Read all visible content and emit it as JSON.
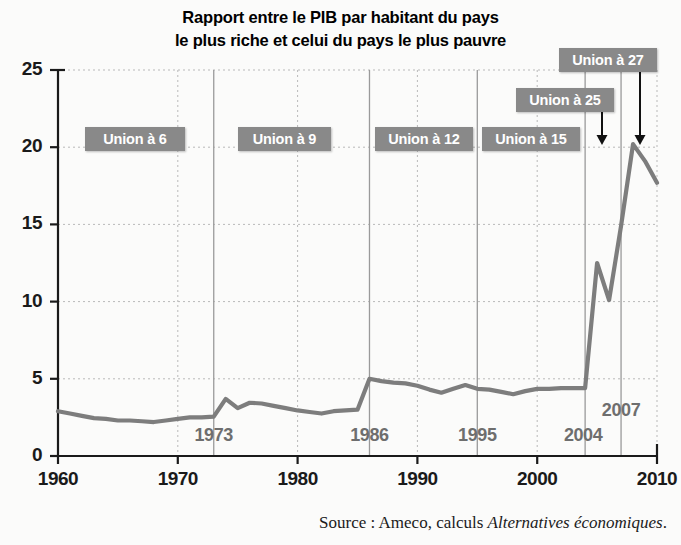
{
  "title": {
    "line1": "Rapport entre le PIB par habitant du pays",
    "line2": "le plus riche et celui du pays le plus pauvre"
  },
  "source": {
    "prefix": "Source : Ameco, calculs ",
    "emphasis": "Alternatives économiques",
    "suffix": "."
  },
  "colors": {
    "line": "#7d7d7d",
    "badge_bg": "#898989",
    "badge_text": "#ffffff",
    "axis": "#1a1a1a",
    "grid": "#b9b9b9",
    "event_line": "#9a9a9a",
    "event_label": "#6e6e6e",
    "arrow": "#111111",
    "background": "#fbfbfa"
  },
  "badges": [
    {
      "label": "Union à 6",
      "x": 85,
      "y": 127,
      "width": 100
    },
    {
      "label": "Union à 9",
      "x": 238,
      "y": 127,
      "width": 93
    },
    {
      "label": "Union à 12",
      "x": 375,
      "y": 127,
      "width": 98
    },
    {
      "label": "Union à 15",
      "x": 482,
      "y": 127,
      "width": 98
    },
    {
      "label": "Union à 25",
      "x": 516,
      "y": 88,
      "width": 98
    },
    {
      "label": "Union à 27",
      "x": 559,
      "y": 48,
      "width": 98
    }
  ],
  "arrows": [
    {
      "name": "arrow-union-25",
      "x": 602,
      "y_top": 100,
      "y_bottom": 145
    },
    {
      "name": "arrow-union-27",
      "x": 640,
      "y_top": 62,
      "y_bottom": 145
    }
  ],
  "chart_data": {
    "type": "line",
    "title": "Rapport entre le PIB par habitant du pays le plus riche et celui du pays le plus pauvre",
    "xlabel": "",
    "ylabel": "",
    "xlim": [
      1960,
      2010
    ],
    "ylim": [
      0,
      25
    ],
    "grid": true,
    "legend": "none",
    "yticks": [
      0,
      5,
      10,
      15,
      20,
      25
    ],
    "xticks": [
      1960,
      1970,
      1980,
      1990,
      2000,
      2010
    ],
    "series": [
      {
        "name": "Rapport PIB par habitant max/min",
        "x": [
          1960,
          1961,
          1962,
          1963,
          1964,
          1965,
          1966,
          1967,
          1968,
          1969,
          1970,
          1971,
          1972,
          1973,
          1974,
          1975,
          1976,
          1977,
          1978,
          1979,
          1980,
          1981,
          1982,
          1983,
          1984,
          1985,
          1986,
          1987,
          1988,
          1989,
          1990,
          1991,
          1992,
          1993,
          1994,
          1995,
          1996,
          1997,
          1998,
          1999,
          2000,
          2001,
          2002,
          2003,
          2004,
          2005,
          2006,
          2007,
          2008,
          2009,
          2010
        ],
        "values": [
          2.9,
          2.75,
          2.6,
          2.45,
          2.4,
          2.3,
          2.3,
          2.25,
          2.2,
          2.3,
          2.4,
          2.5,
          2.5,
          2.55,
          3.7,
          3.1,
          3.45,
          3.4,
          3.25,
          3.1,
          2.95,
          2.85,
          2.75,
          2.9,
          2.95,
          3.0,
          5.0,
          4.85,
          4.75,
          4.7,
          4.55,
          4.3,
          4.1,
          4.35,
          4.6,
          4.35,
          4.3,
          4.15,
          4.0,
          4.2,
          4.35,
          4.35,
          4.4,
          4.4,
          4.4,
          12.5,
          10.1,
          14.9,
          20.2,
          19.1,
          17.7
        ]
      }
    ],
    "event_markers": [
      {
        "year": 1973,
        "label": "1973"
      },
      {
        "year": 1986,
        "label": "1986"
      },
      {
        "year": 1995,
        "label": "1995"
      },
      {
        "year": 2004,
        "label": "2004"
      },
      {
        "year": 2007,
        "label": "2007"
      }
    ],
    "annotations": [
      "Union à 6",
      "Union à 9",
      "Union à 12",
      "Union à 15",
      "Union à 25",
      "Union à 27"
    ]
  },
  "geometry": {
    "left": 58,
    "right": 657,
    "top": 70,
    "bottom": 456
  }
}
